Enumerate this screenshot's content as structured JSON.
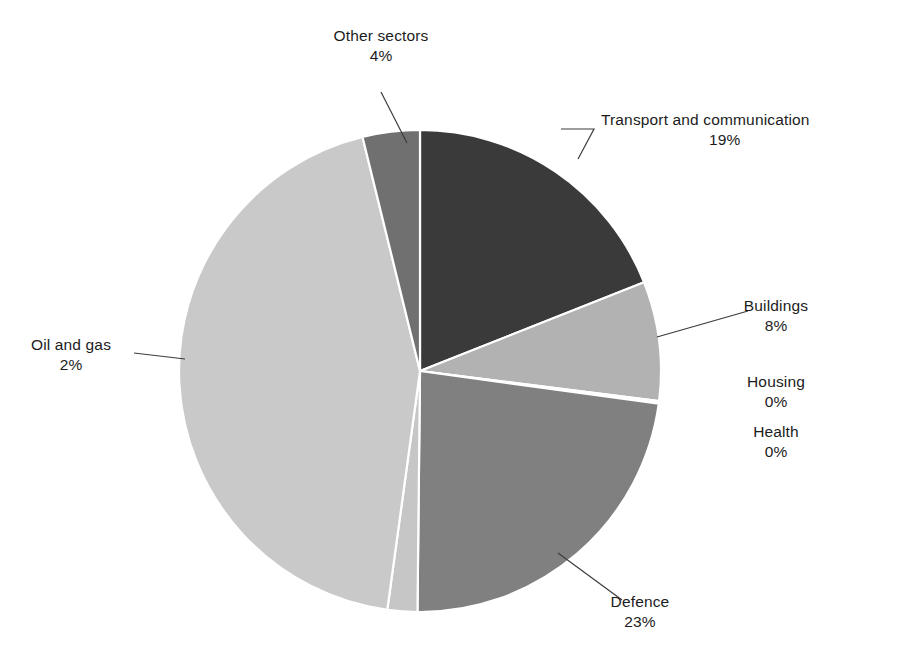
{
  "chart_data": {
    "type": "pie",
    "title": "",
    "subtitle": "",
    "xlabel": "",
    "ylabel": "",
    "legend_position": "none",
    "grid": false,
    "units": "percent",
    "labels_show_percent": true,
    "categories": [
      "Transport and communication",
      "Buildings",
      "Housing",
      "Health",
      "Defence",
      "Oil and gas",
      "Other sectors"
    ],
    "values": [
      19,
      8,
      0,
      0,
      23,
      2,
      4
    ],
    "slices": [
      {
        "name": "Transport and communication",
        "value": 19,
        "percent_label": "19%",
        "color": "#3a3a3a",
        "start_angle": 0,
        "end_angle": 68.4
      },
      {
        "name": "Buildings",
        "value": 8,
        "percent_label": "8%",
        "color": "#b2b2b2",
        "start_angle": 68.4,
        "end_angle": 97.2
      },
      {
        "name": "Housing",
        "value": 0,
        "percent_label": "0%",
        "color": "#9a9a9a",
        "start_angle": 97.2,
        "end_angle": 97.5
      },
      {
        "name": "Health",
        "value": 0,
        "percent_label": "0%",
        "color": "#8f8f8f",
        "start_angle": 97.5,
        "end_angle": 97.8
      },
      {
        "name": "Defence",
        "value": 23,
        "percent_label": "23%",
        "color": "#808080",
        "start_angle": 97.8,
        "end_angle": 180.6
      },
      {
        "name": "Oil and gas",
        "value": 2,
        "percent_label": "2%",
        "color": "#c6c6c6",
        "start_angle": 180.6,
        "end_angle": 187.8
      },
      {
        "name": "Unlabelled remainder",
        "value": 44,
        "percent_label": "",
        "color": "#c9c9c9",
        "start_angle": 187.8,
        "end_angle": 346.2
      },
      {
        "name": "Other sectors",
        "value": 4,
        "percent_label": "4%",
        "color": "#707070",
        "start_angle": 346.2,
        "end_angle": 360
      }
    ],
    "geometry": {
      "center_x": 420,
      "center_y": 371,
      "radius": 241,
      "separator_color": "#ffffff",
      "separator_width": 2.2,
      "background": "#ffffff"
    },
    "leader_line_color": "#3c3c3c"
  },
  "labels": {
    "other_sectors": {
      "name": "Other sectors",
      "pct": "4%"
    },
    "transport": {
      "name": "Transport and communication",
      "pct": "19%"
    },
    "buildings": {
      "name": "Buildings",
      "pct": "8%"
    },
    "housing": {
      "name": "Housing",
      "pct": "0%"
    },
    "health": {
      "name": "Health",
      "pct": "0%"
    },
    "defence": {
      "name": "Defence",
      "pct": "23%"
    },
    "oil_and_gas": {
      "name": "Oil and gas",
      "pct": "2%"
    }
  }
}
